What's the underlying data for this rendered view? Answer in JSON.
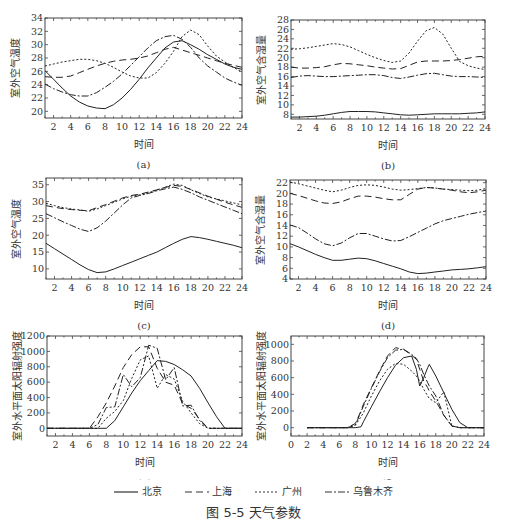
{
  "figure_caption": "图 5-5   天气参数",
  "legend": [
    {
      "name": "北京",
      "dash": "none"
    },
    {
      "name": "上海",
      "dash": "7,4"
    },
    {
      "name": "广州",
      "dash": "2,2"
    },
    {
      "name": "乌鲁木齐",
      "dash": "7,2,2,2"
    }
  ],
  "chart_data": [
    {
      "id": "a",
      "type": "line",
      "label": "(a)",
      "xlabel": "时间",
      "ylabel": "室外空气温度",
      "xlim": [
        1,
        24
      ],
      "ylim": [
        19,
        34
      ],
      "xticks": [
        2,
        4,
        6,
        8,
        10,
        12,
        14,
        16,
        18,
        20,
        22,
        24
      ],
      "yticks": [
        20,
        22,
        24,
        26,
        28,
        30,
        32,
        34
      ],
      "box": {
        "x": 45,
        "y": 18,
        "w": 197,
        "h": 100
      },
      "x": [
        1,
        2,
        3,
        4,
        5,
        6,
        7,
        8,
        9,
        10,
        11,
        12,
        13,
        14,
        15,
        16,
        17,
        18,
        19,
        20,
        21,
        22,
        23,
        24
      ],
      "series": [
        {
          "name": "北京",
          "values": [
            26.1,
            24.8,
            23.5,
            22.3,
            21.4,
            20.8,
            20.5,
            20.4,
            21,
            22,
            23.3,
            24.8,
            26.5,
            28,
            29.5,
            30.4,
            30.6,
            30,
            29.3,
            28.5,
            27.8,
            27.1,
            26.6,
            26.3
          ]
        },
        {
          "name": "上海",
          "values": [
            25.2,
            25.1,
            25.1,
            25.3,
            25.8,
            26.3,
            26.8,
            27.2,
            27.5,
            27.7,
            27.8,
            28,
            28.3,
            28.8,
            29.3,
            29.6,
            29.2,
            28.8,
            28.4,
            28,
            27.6,
            27.2,
            26.9,
            26.6
          ]
        },
        {
          "name": "广州",
          "values": [
            26.8,
            27.1,
            27.4,
            27.6,
            27.8,
            27.8,
            27.6,
            27.2,
            26.6,
            25.9,
            25.3,
            25,
            25,
            25.8,
            27.2,
            29,
            31.2,
            32.2,
            31.5,
            29.8,
            28.3,
            27.4,
            26.6,
            25.9
          ]
        },
        {
          "name": "乌鲁木齐",
          "values": [
            24.1,
            23.4,
            22.9,
            22.5,
            22.3,
            22.3,
            22.8,
            23.6,
            24.5,
            25.6,
            26.9,
            28.2,
            29.5,
            30.6,
            31.2,
            31.4,
            30.8,
            29.6,
            28,
            26.8,
            25.9,
            25,
            24.4,
            23.9
          ]
        }
      ]
    },
    {
      "id": "b",
      "type": "line",
      "label": "(b)",
      "xlabel": "时间",
      "ylabel": "室外空气含湿量",
      "xlim": [
        1,
        24
      ],
      "ylim": [
        7,
        28
      ],
      "xticks": [
        2,
        4,
        6,
        8,
        10,
        12,
        14,
        16,
        18,
        20,
        22,
        24
      ],
      "yticks": [
        8,
        10,
        12,
        14,
        16,
        18,
        20,
        22,
        24,
        26,
        28
      ],
      "box": {
        "x": 291,
        "y": 20,
        "w": 194,
        "h": 99
      },
      "x": [
        1,
        2,
        3,
        4,
        5,
        6,
        7,
        8,
        9,
        10,
        11,
        12,
        13,
        14,
        15,
        16,
        17,
        18,
        19,
        20,
        21,
        22,
        23,
        24
      ],
      "series": [
        {
          "name": "北京",
          "values": [
            7.4,
            7.4,
            7.5,
            7.6,
            7.8,
            8.1,
            8.4,
            8.6,
            8.6,
            8.6,
            8.5,
            8.3,
            8.1,
            7.9,
            7.8,
            7.9,
            8,
            8.1,
            8.1,
            8.1,
            8.1,
            8.2,
            8.3,
            8.5
          ]
        },
        {
          "name": "上海",
          "values": [
            18,
            17.8,
            17.8,
            17.9,
            18.1,
            18.5,
            18.8,
            18.7,
            18.5,
            18.3,
            18,
            17.8,
            17.6,
            17.7,
            18.4,
            19.1,
            19.3,
            19.3,
            19.3,
            19.4,
            19.6,
            19.9,
            20.2,
            20.3
          ]
        },
        {
          "name": "广州",
          "values": [
            21.8,
            21.9,
            22.1,
            22.4,
            22.7,
            23,
            22.8,
            22.3,
            21.5,
            20.7,
            20,
            19.4,
            19,
            19.3,
            21,
            23.5,
            25.7,
            26.4,
            25,
            22,
            19.2,
            18.3,
            17.8,
            17.5
          ]
        },
        {
          "name": "乌鲁木齐",
          "values": [
            15.8,
            16.1,
            16.2,
            16.1,
            16,
            16,
            16.1,
            16.2,
            16.3,
            16.4,
            16.4,
            16.2,
            15.8,
            15.6,
            15.9,
            16.3,
            16.6,
            16.7,
            16.4,
            16.1,
            16,
            16,
            15.9,
            15.8
          ]
        }
      ]
    },
    {
      "id": "c",
      "type": "line",
      "label": "(c)",
      "xlabel": "时间",
      "ylabel": "室外空气温度",
      "xlim": [
        1,
        24
      ],
      "ylim": [
        7,
        37
      ],
      "xticks": [
        2,
        4,
        6,
        8,
        10,
        12,
        14,
        16,
        18,
        20,
        22,
        24
      ],
      "yticks": [
        10,
        15,
        20,
        25,
        30,
        35
      ],
      "box": {
        "x": 46,
        "y": 178,
        "w": 196,
        "h": 101
      },
      "x": [
        1,
        2,
        3,
        4,
        5,
        6,
        7,
        8,
        9,
        10,
        11,
        12,
        13,
        14,
        15,
        16,
        17,
        18,
        19,
        20,
        21,
        22,
        23,
        24
      ],
      "series": [
        {
          "name": "北京",
          "values": [
            17.6,
            16,
            14.4,
            12.8,
            11.2,
            9.8,
            8.9,
            9.1,
            10,
            11,
            12,
            13,
            14,
            15,
            16.3,
            17.6,
            18.8,
            19.6,
            19.3,
            18.8,
            18.2,
            17.6,
            17,
            16.3
          ]
        },
        {
          "name": "上海",
          "values": [
            28.8,
            28.3,
            27.9,
            27.6,
            27.4,
            27.3,
            28.2,
            29.1,
            30.1,
            31.1,
            31.8,
            32.2,
            32.8,
            33.5,
            34.2,
            34.8,
            34.5,
            33.6,
            32.6,
            31.6,
            30.7,
            29.8,
            29,
            28.3
          ]
        },
        {
          "name": "广州",
          "values": [
            29.5,
            28.8,
            28.2,
            27.8,
            27.5,
            27.1,
            27.8,
            28.8,
            29.8,
            30.8,
            31.6,
            32,
            32.6,
            33.4,
            34.3,
            35.2,
            34.8,
            33.5,
            32.4,
            31.4,
            30.8,
            30.2,
            29.6,
            29
          ]
        },
        {
          "name": "乌鲁木齐",
          "values": [
            26.4,
            25.2,
            24,
            22.9,
            21.8,
            21.1,
            22.2,
            24.2,
            26.6,
            29,
            31.1,
            31.8,
            32.4,
            33.2,
            33.8,
            34.3,
            33.6,
            32.6,
            31.4,
            30.4,
            29.4,
            28.4,
            27.4,
            26.4
          ]
        }
      ]
    },
    {
      "id": "d",
      "type": "line",
      "label": "(d)",
      "xlabel": "时间",
      "ylabel": "室外空气含湿量",
      "xlim": [
        1,
        24
      ],
      "ylim": [
        4,
        22.5
      ],
      "xticks": [
        2,
        4,
        6,
        8,
        10,
        12,
        14,
        16,
        18,
        20,
        22,
        24
      ],
      "yticks": [
        4,
        6,
        8,
        10,
        12,
        14,
        16,
        18,
        20,
        22
      ],
      "box": {
        "x": 290,
        "y": 180,
        "w": 196,
        "h": 99
      },
      "x": [
        1,
        2,
        3,
        4,
        5,
        6,
        7,
        8,
        9,
        10,
        11,
        12,
        13,
        14,
        15,
        16,
        17,
        18,
        19,
        20,
        21,
        22,
        23,
        24
      ],
      "series": [
        {
          "name": "北京",
          "values": [
            10.6,
            10,
            9.3,
            8.6,
            8,
            7.5,
            7.5,
            7.7,
            7.9,
            7.8,
            7.4,
            6.9,
            6.4,
            5.9,
            5.3,
            5,
            5.1,
            5.3,
            5.5,
            5.7,
            5.8,
            5.9,
            6.1,
            6.3
          ]
        },
        {
          "name": "上海",
          "values": [
            20,
            19.6,
            19.1,
            18.6,
            18.2,
            18.1,
            18.4,
            19,
            19.5,
            19.5,
            19.3,
            19,
            18.8,
            18.8,
            19.8,
            20.8,
            21.1,
            21,
            20.8,
            20.6,
            20.3,
            20.1,
            20.3,
            20.6
          ]
        },
        {
          "name": "广州",
          "values": [
            22.1,
            21.8,
            21.4,
            21,
            20.6,
            20.3,
            20.6,
            21.1,
            21.5,
            21.6,
            21.5,
            21.2,
            20.8,
            20.6,
            20.7,
            20.9,
            21.1,
            21,
            20.8,
            20.7,
            20.6,
            20.5,
            20.6,
            20.9
          ]
        },
        {
          "name": "乌鲁木齐",
          "values": [
            14.1,
            13.6,
            12.6,
            11.5,
            10.6,
            10.2,
            10.7,
            11.7,
            12.5,
            12.5,
            12,
            11.5,
            11.1,
            11.2,
            11.9,
            12.7,
            13.5,
            14.3,
            14.9,
            15.3,
            15.7,
            16.1,
            16.4,
            16.7
          ]
        }
      ]
    },
    {
      "id": "e",
      "type": "line",
      "label": "(e)",
      "xlabel": "时间",
      "ylabel": "室外水平面太阳辐射强度",
      "xlim": [
        1,
        24
      ],
      "ylim": [
        -100,
        1200
      ],
      "xticks": [
        2,
        4,
        6,
        8,
        10,
        12,
        14,
        16,
        18,
        20,
        22,
        24
      ],
      "yticks": [
        0,
        200,
        400,
        600,
        800,
        1000,
        1200
      ],
      "box": {
        "x": 47,
        "y": 336,
        "w": 195,
        "h": 100
      },
      "x": [
        1,
        2,
        3,
        4,
        5,
        6,
        7,
        8,
        9,
        10,
        11,
        12,
        13,
        14,
        15,
        16,
        17,
        18,
        19,
        20,
        21,
        22,
        23,
        24
      ],
      "series": [
        {
          "name": "北京",
          "values": [
            0,
            0,
            0,
            0,
            0,
            0,
            0,
            0,
            100,
            280,
            460,
            620,
            750,
            880,
            870,
            830,
            760,
            680,
            520,
            330,
            150,
            0,
            0,
            0
          ]
        },
        {
          "name": "上海",
          "values": [
            0,
            0,
            0,
            0,
            0,
            0,
            150,
            330,
            550,
            790,
            960,
            1060,
            1060,
            780,
            600,
            560,
            320,
            260,
            120,
            0,
            0,
            0,
            0,
            0
          ]
        },
        {
          "name": "广州",
          "values": [
            0,
            0,
            0,
            0,
            0,
            0,
            0,
            130,
            220,
            360,
            650,
            890,
            940,
            520,
            700,
            640,
            350,
            200,
            60,
            0,
            0,
            0,
            0,
            0
          ]
        },
        {
          "name": "乌鲁木齐",
          "values": [
            0,
            0,
            0,
            0,
            0,
            0,
            50,
            270,
            280,
            700,
            540,
            660,
            1080,
            1040,
            630,
            790,
            290,
            300,
            100,
            0,
            0,
            0,
            0,
            0
          ]
        }
      ]
    },
    {
      "id": "f",
      "type": "line",
      "label": "(f)",
      "xlabel": "时间",
      "ylabel": "室外水平面太阳辐射强度",
      "xlim": [
        0,
        24
      ],
      "ylim": [
        -100,
        1100
      ],
      "xticks": [
        0,
        2,
        4,
        6,
        8,
        10,
        12,
        14,
        16,
        18,
        20,
        22,
        24
      ],
      "yticks": [
        0,
        200,
        400,
        600,
        800,
        1000
      ],
      "box": {
        "x": 291,
        "y": 336,
        "w": 193,
        "h": 100
      },
      "x": [
        2,
        3,
        4,
        5,
        6,
        7,
        8,
        8.7,
        9,
        10,
        11,
        12,
        13,
        14,
        15,
        15.6,
        16,
        16.5,
        17,
        17.2,
        18,
        19,
        20,
        21,
        22,
        23,
        24
      ],
      "series": [
        {
          "name": "北京",
          "values": [
            0,
            0,
            0,
            0,
            0,
            0,
            0,
            10,
            70,
            250,
            430,
            600,
            750,
            840,
            860,
            700,
            500,
            600,
            720,
            760,
            620,
            420,
            220,
            60,
            0,
            0,
            0
          ]
        },
        {
          "name": "上海",
          "values": [
            0,
            0,
            0,
            0,
            0,
            0,
            50,
            200,
            280,
            480,
            680,
            860,
            960,
            940,
            870,
            820,
            700,
            560,
            480,
            440,
            320,
            150,
            20,
            0,
            0,
            0,
            0
          ]
        },
        {
          "name": "广州",
          "values": [
            0,
            0,
            0,
            0,
            0,
            0,
            30,
            130,
            180,
            380,
            560,
            700,
            770,
            760,
            680,
            620,
            560,
            460,
            380,
            350,
            300,
            430,
            20,
            0,
            0,
            0,
            0
          ]
        },
        {
          "name": "乌鲁木齐",
          "values": [
            0,
            0,
            0,
            0,
            0,
            0,
            30,
            190,
            260,
            470,
            670,
            840,
            930,
            940,
            880,
            830,
            760,
            640,
            540,
            500,
            380,
            150,
            20,
            0,
            0,
            0,
            0
          ]
        }
      ]
    }
  ]
}
